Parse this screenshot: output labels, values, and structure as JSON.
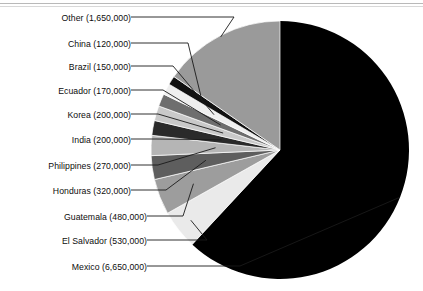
{
  "chart_data": {
    "type": "pie",
    "title": "",
    "units": "people",
    "total": 10740000,
    "start_angle_deg": 0,
    "direction": "clockwise",
    "legend": "leader-line labels at left",
    "categories": [
      "Mexico",
      "El Salvador",
      "Guatemala",
      "Honduras",
      "Philippines",
      "India",
      "Korea",
      "Ecuador",
      "Brazil",
      "China",
      "Other"
    ],
    "values": [
      6650000,
      530000,
      480000,
      320000,
      270000,
      200000,
      200000,
      170000,
      150000,
      120000,
      1650000
    ],
    "value_labels": [
      "6,650,000",
      "530,000",
      "480,000",
      "320,000",
      "270,000",
      "200,000",
      "200,000",
      "170,000",
      "150,000",
      "120,000",
      "1,650,000"
    ],
    "slices": [
      {
        "name": "Mexico",
        "label": "Mexico (6,650,000)",
        "value": 6650000,
        "value_label": "6,650,000",
        "color": "#000000"
      },
      {
        "name": "El Salvador",
        "label": "El Salvador (530,000)",
        "value": 530000,
        "value_label": "530,000",
        "color": "#eaeaea"
      },
      {
        "name": "Guatemala",
        "label": "Guatemala (480,000)",
        "value": 480000,
        "value_label": "480,000",
        "color": "#9d9d9d"
      },
      {
        "name": "Honduras",
        "label": "Honduras (320,000)",
        "value": 320000,
        "value_label": "320,000",
        "color": "#5e5e5e"
      },
      {
        "name": "Philippines",
        "label": "Philippines (270,000)",
        "value": 270000,
        "value_label": "270,000",
        "color": "#b5b5b5"
      },
      {
        "name": "India",
        "label": "India (200,000)",
        "value": 200000,
        "value_label": "200,000",
        "color": "#2a2a2a"
      },
      {
        "name": "Korea",
        "label": "Korea (200,000)",
        "value": 200000,
        "value_label": "200,000",
        "color": "#c9c9c9"
      },
      {
        "name": "Ecuador",
        "label": "Ecuador (170,000)",
        "value": 170000,
        "value_label": "170,000",
        "color": "#6e6e6e"
      },
      {
        "name": "Brazil",
        "label": "Brazil (150,000)",
        "value": 150000,
        "value_label": "150,000",
        "color": "#efefef"
      },
      {
        "name": "China",
        "label": "China (120,000)",
        "value": 120000,
        "value_label": "120,000",
        "color": "#111111"
      },
      {
        "name": "Other",
        "label": "Other (1,650,000)",
        "value": 1650000,
        "value_label": "1,650,000",
        "color": "#9a9a9a"
      }
    ]
  },
  "labels": {
    "other": "Other (1,650,000)",
    "china": "China (120,000)",
    "brazil": "Brazil (150,000)",
    "ecuador": "Ecuador (170,000)",
    "korea": "Korea (200,000)",
    "india": "India (200,000)",
    "philippines": "Philippines (270,000)",
    "honduras": "Honduras (320,000)",
    "guatemala": "Guatemala (480,000)",
    "el_salvador": "El Salvador (530,000)",
    "mexico": "Mexico (6,650,000)"
  }
}
